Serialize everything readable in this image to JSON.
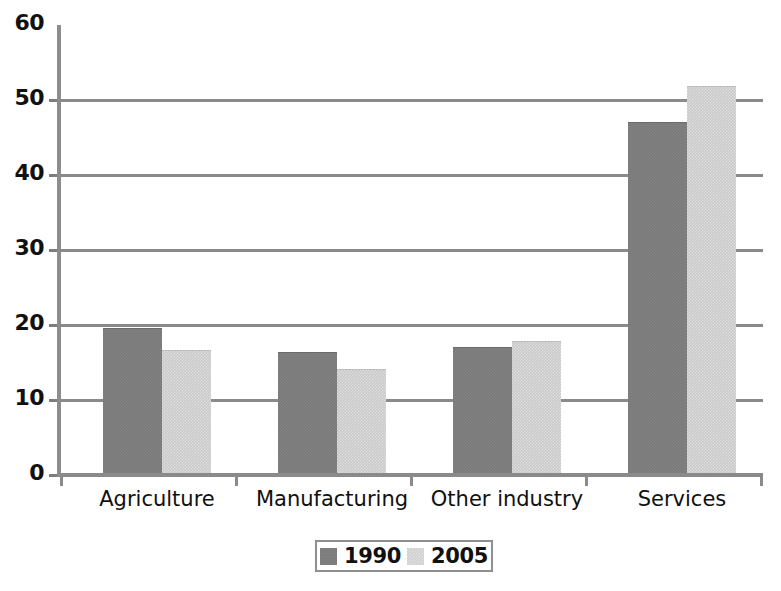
{
  "chart_data": {
    "type": "bar",
    "title": "",
    "subtitle": "",
    "xlabel": "",
    "ylabel": "",
    "categories": [
      "Agriculture",
      "Manufacturing",
      "Other industry",
      "Services"
    ],
    "series": [
      {
        "name": "1990",
        "color": "#7a7a7a",
        "values": [
          19.5,
          16.3,
          17.0,
          47.0
        ]
      },
      {
        "name": "2005",
        "color": "#c9c9c9",
        "values": [
          16.5,
          14.0,
          17.7,
          51.8
        ]
      }
    ],
    "ylim": [
      0,
      60
    ],
    "ytick_labels": [
      "0",
      "10",
      "20",
      "30",
      "40",
      "50",
      "60"
    ],
    "ytick_values": [
      0,
      10,
      20,
      30,
      40,
      50,
      60
    ],
    "grid": true,
    "grid_axis": "y",
    "legend_position": "bottom",
    "legend_entries": [
      "1990",
      "2005"
    ]
  },
  "axis": {
    "y_labels": [
      "60",
      "50",
      "40",
      "30",
      "20",
      "10",
      "0"
    ],
    "x_labels": [
      "Agriculture",
      "Manufacturing",
      "Other industry",
      "Services"
    ]
  },
  "legend": {
    "entries": [
      {
        "label": "1990",
        "swatch": "dark-gray-swatch"
      },
      {
        "label": "2005",
        "swatch": "light-gray-swatch"
      }
    ]
  }
}
